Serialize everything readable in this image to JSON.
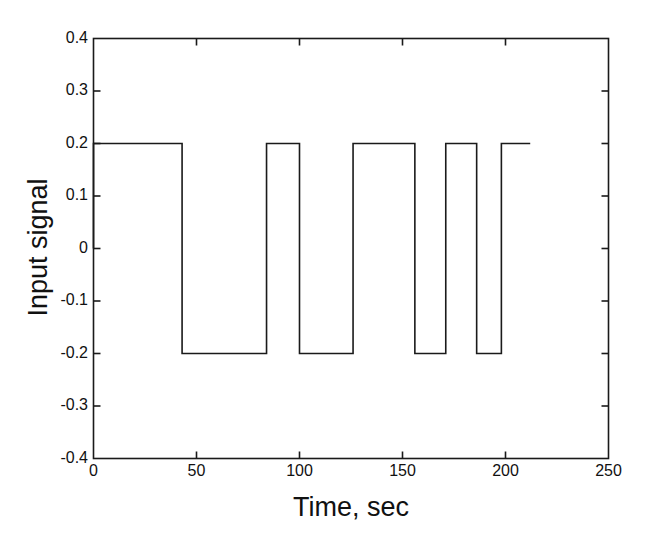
{
  "chart_data": {
    "type": "line",
    "title": "",
    "subtitle": "",
    "xlabel": "Time, sec",
    "ylabel": "Input signal",
    "xlim": [
      0,
      250
    ],
    "ylim": [
      -0.4,
      0.4
    ],
    "xticks": [
      0,
      50,
      100,
      150,
      200,
      250
    ],
    "xtick_labels": [
      "0",
      "50",
      "100",
      "150",
      "200",
      "250"
    ],
    "yticks": [
      -0.4,
      -0.3,
      -0.2,
      -0.1,
      0,
      0.1,
      0.2,
      0.3,
      0.4
    ],
    "ytick_labels": [
      "-0.4",
      "-0.3",
      "-0.2",
      "-0.1",
      "0",
      "0.1",
      "0.2",
      "0.3",
      "0.4"
    ],
    "grid": false,
    "legend": false,
    "legend_position": "none",
    "line_color": "#1a1a1a",
    "line_width": 1.6,
    "background": "#ffffff",
    "axis_color": "#1a1a1a",
    "series": [
      {
        "name": "Input signal",
        "style": "square-wave",
        "high_level": 0.2,
        "low_level": -0.2,
        "x": [
          0,
          0,
          43,
          43,
          84,
          84,
          100,
          100,
          126,
          126,
          156,
          156,
          171,
          171,
          186,
          186,
          198,
          198,
          212
        ],
        "y": [
          0,
          0.2,
          0.2,
          -0.2,
          -0.2,
          0.2,
          0.2,
          -0.2,
          -0.2,
          0.2,
          0.2,
          -0.2,
          -0.2,
          0.2,
          0.2,
          -0.2,
          -0.2,
          0.2,
          0.2
        ],
        "segments": [
          {
            "from": 0,
            "to": 43,
            "level": 0.2
          },
          {
            "from": 43,
            "to": 84,
            "level": -0.2
          },
          {
            "from": 84,
            "to": 100,
            "level": 0.2
          },
          {
            "from": 100,
            "to": 126,
            "level": -0.2
          },
          {
            "from": 126,
            "to": 156,
            "level": 0.2
          },
          {
            "from": 156,
            "to": 171,
            "level": -0.2
          },
          {
            "from": 171,
            "to": 186,
            "level": 0.2
          },
          {
            "from": 186,
            "to": 198,
            "level": -0.2
          },
          {
            "from": 198,
            "to": 212,
            "level": 0.2
          }
        ]
      }
    ]
  }
}
